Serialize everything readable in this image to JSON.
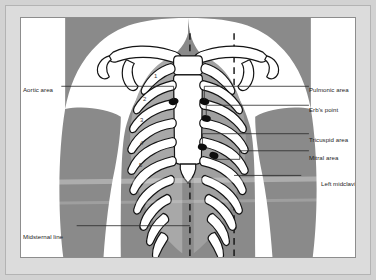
{
  "figure": {
    "colors": {
      "mat": "#dcdcdc",
      "plate_border": "#8d8d8d",
      "body": "#8a8a8a",
      "bone_fill": "#ffffff",
      "bone_outline": "#1a1a1a",
      "intercostal": "#b0b0b0",
      "marker": "#0d0d0d",
      "leader": "#2b2b2b",
      "text": "#1c1c1c"
    }
  },
  "labels": {
    "left": [
      {
        "id": "aortic-area",
        "text": "Aortic area",
        "x": 16,
        "y": 84,
        "leader": {
          "x1": 59,
          "y1": 87,
          "x2": 172,
          "y2": 87
        }
      },
      {
        "id": "midsternal-line",
        "text": "Midsternal line",
        "x": 16,
        "y": 229,
        "leader": {
          "x1": 72,
          "y1": 232,
          "x2": 186,
          "y2": 232
        }
      }
    ],
    "right": [
      {
        "id": "pulmonic-area",
        "text": "Pulmonic area",
        "x": 306,
        "y": 85,
        "leader": {
          "x1": 204,
          "y1": 88,
          "x2": 303,
          "y2": 88
        }
      },
      {
        "id": "erbs-point",
        "text": "Erb's point",
        "x": 321,
        "y": 102,
        "leader": {
          "x1": 206,
          "y1": 105,
          "x2": 318,
          "y2": 105
        }
      },
      {
        "id": "tricuspid-area",
        "text": "Tricuspid area",
        "x": 305,
        "y": 133,
        "leader": {
          "x1": 203,
          "y1": 136,
          "x2": 302,
          "y2": 136
        }
      },
      {
        "id": "mitral-area",
        "text": "Mitral area",
        "x": 320,
        "y": 150,
        "leader": {
          "x1": 211,
          "y1": 142,
          "x2": 317,
          "y2": 153
        }
      }
    ],
    "right_wrapped": [
      {
        "id": "left-midclavicular-line",
        "line1": "Left midclavicular",
        "line2": "line",
        "x": 292,
        "y": 178,
        "leader": {
          "x1": 236,
          "y1": 181,
          "x2": 289,
          "y2": 181
        }
      }
    ]
  },
  "rib_numbers": [
    {
      "n": "1",
      "x": 152,
      "y": 66
    },
    {
      "n": "2",
      "x": 140,
      "y": 88
    },
    {
      "n": "3",
      "x": 137,
      "y": 108
    },
    {
      "n": "4",
      "x": 137,
      "y": 131
    },
    {
      "n": "5",
      "x": 136,
      "y": 152
    }
  ],
  "auscultation_sites": [
    {
      "id": "aortic",
      "label": "Aortic area",
      "cx": 173,
      "cy": 88,
      "rx": 5.0,
      "ry": 3.6
    },
    {
      "id": "pulmonic",
      "label": "Pulmonic area",
      "cx": 201,
      "cy": 88,
      "rx": 5.0,
      "ry": 3.6
    },
    {
      "id": "erbs",
      "label": "Erb's point",
      "cx": 203,
      "cy": 105,
      "rx": 4.6,
      "ry": 3.3
    },
    {
      "id": "tricuspid",
      "label": "Tricuspid area",
      "cx": 200,
      "cy": 135,
      "rx": 4.6,
      "ry": 3.4
    },
    {
      "id": "mitral",
      "label": "Mitral area",
      "cx": 211,
      "cy": 143,
      "rx": 4.6,
      "ry": 3.4
    }
  ],
  "reference_lines": [
    {
      "id": "midsternal",
      "label": "Midsternal line",
      "x": 190,
      "y1": 16,
      "y2": 252
    },
    {
      "id": "left-midclavicular",
      "label": "Left midclavicular line",
      "x": 236,
      "y1": 16,
      "y2": 252
    }
  ]
}
